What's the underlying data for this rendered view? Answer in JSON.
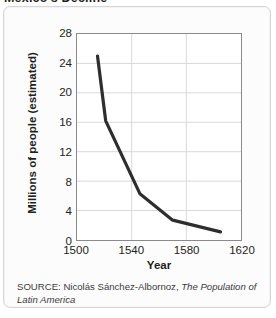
{
  "figure": {
    "title": "Mexico's Decline",
    "source_prefix": "SOURCE: Nicolás Sánchez-Albornoz,",
    "source_work": "The Population of Latin America",
    "panel_background": "#fcfcfc",
    "panel_border": "#d6d6d6"
  },
  "chart_data": {
    "type": "line",
    "title": "Mexico's Decline",
    "xlabel": "Year",
    "ylabel": "Millions of people (estimated)",
    "xlim": [
      1500,
      1620
    ],
    "ylim": [
      0,
      28
    ],
    "xticks": [
      1500,
      1540,
      1580,
      1620
    ],
    "yticks": [
      0,
      4,
      8,
      12,
      16,
      20,
      24,
      28
    ],
    "grid": true,
    "gridlines_horizontal": [
      4,
      8,
      12,
      16,
      20,
      24
    ],
    "gridlines_vertical": [
      1540,
      1580
    ],
    "legend": null,
    "line_color": "#2e2e2e",
    "line_width": 3.2,
    "x": [
      1515,
      1521,
      1546,
      1570,
      1605
    ],
    "values": [
      25.0,
      16.2,
      6.3,
      2.7,
      1.1
    ],
    "series": [
      {
        "name": "Millions of people (estimated)",
        "points": [
          {
            "year": 1515,
            "value": 25.0
          },
          {
            "year": 1521,
            "value": 16.2
          },
          {
            "year": 1546,
            "value": 6.3
          },
          {
            "year": 1570,
            "value": 2.7
          },
          {
            "year": 1605,
            "value": 1.1
          }
        ]
      }
    ]
  }
}
